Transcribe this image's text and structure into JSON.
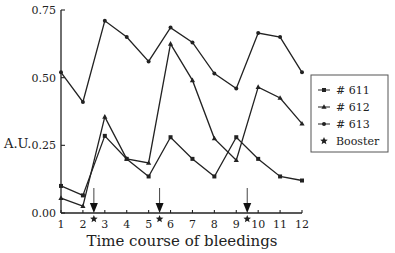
{
  "chart_data": {
    "type": "line",
    "title": "",
    "xlabel": "Time course of bleedings",
    "ylabel": "A.U.",
    "x": [
      1,
      2,
      3,
      4,
      5,
      6,
      7,
      8,
      9,
      10,
      11,
      12
    ],
    "xticks": [
      "1",
      "2",
      "3",
      "4",
      "5",
      "6",
      "7",
      "8",
      "9",
      "10",
      "11",
      "12"
    ],
    "yticks": [
      "0.00",
      "0.25",
      "0.50",
      "0.75"
    ],
    "ylim": [
      0,
      0.75
    ],
    "xlim": [
      1,
      12
    ],
    "grid": false,
    "legend_position": "right",
    "series": [
      {
        "name": "# 611",
        "marker": "square",
        "values": [
          0.1,
          0.065,
          0.285,
          0.2,
          0.135,
          0.28,
          0.2,
          0.135,
          0.28,
          0.2,
          0.135,
          0.12
        ]
      },
      {
        "name": "# 612",
        "marker": "triangle",
        "values": [
          0.055,
          0.025,
          0.355,
          0.2,
          0.185,
          0.625,
          0.49,
          0.275,
          0.195,
          0.465,
          0.425,
          0.33
        ]
      },
      {
        "name": "# 613",
        "marker": "circle",
        "values": [
          0.52,
          0.41,
          0.71,
          0.65,
          0.56,
          0.685,
          0.63,
          0.515,
          0.46,
          0.665,
          0.65,
          0.52
        ]
      }
    ],
    "annotations": [
      {
        "type": "arrow",
        "label": "Booster",
        "marker": "star",
        "x": 2.5
      },
      {
        "type": "arrow",
        "label": "Booster",
        "marker": "star",
        "x": 5.5
      },
      {
        "type": "arrow",
        "label": "Booster",
        "marker": "star",
        "x": 9.5
      }
    ],
    "legend": [
      {
        "label": "# 611",
        "marker": "square"
      },
      {
        "label": "# 612",
        "marker": "triangle"
      },
      {
        "label": "# 613",
        "marker": "circle"
      },
      {
        "label": "Booster",
        "marker": "star"
      }
    ]
  }
}
